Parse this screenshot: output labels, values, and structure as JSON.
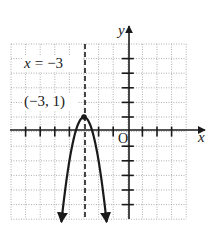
{
  "figure": {
    "axis_labels": {
      "x": "x",
      "y": "y",
      "origin": "O"
    },
    "asymptote_label": "x = −3",
    "vertex_label": "(−3, 1)",
    "colors": {
      "ink": "#1a1a1a",
      "grid": "#9a9a9a",
      "background": "#ffffff"
    }
  },
  "chart_data": {
    "type": "line",
    "title": "",
    "function": "y = -3(x + 3)^2 + 1",
    "xlabel": "x",
    "ylabel": "y",
    "xlim": [
      -8,
      4
    ],
    "ylim": [
      -6,
      6
    ],
    "grid": true,
    "axis_of_symmetry": {
      "x": -3,
      "label": "x = −3",
      "style": "dashed"
    },
    "vertex": {
      "x": -3,
      "y": 1,
      "label": "(−3, 1)"
    },
    "series": [
      {
        "name": "parabola",
        "x": [
          -4.55,
          -4.5,
          -4,
          -3.5,
          -3,
          -2.5,
          -2,
          -1.5,
          -1.45
        ],
        "y": [
          -6.2,
          -5.75,
          -2,
          0.25,
          1,
          0.25,
          -2,
          -5.75,
          -6.2
        ]
      }
    ],
    "x_ticks": [
      -8,
      -7,
      -6,
      -5,
      -4,
      -3,
      -2,
      -1,
      0,
      1,
      2,
      3,
      4
    ],
    "y_ticks": [
      -6,
      -5,
      -4,
      -3,
      -2,
      -1,
      0,
      1,
      2,
      3,
      4,
      5,
      6
    ]
  }
}
